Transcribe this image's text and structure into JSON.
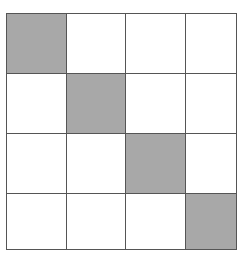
{
  "diagram": {
    "type": "grid-matrix",
    "title": "",
    "rows": 4,
    "columns": 4,
    "colors": {
      "filled_cell": "#a8a8a8",
      "empty_cell": "#ffffff",
      "grid_line": "#555555",
      "background": "#ffffff"
    },
    "pattern_description": "main-diagonal",
    "cells": [
      [
        {
          "row": 1,
          "column": 1,
          "state": "filled",
          "label": ""
        },
        {
          "row": 1,
          "column": 2,
          "state": "empty",
          "label": ""
        },
        {
          "row": 1,
          "column": 3,
          "state": "empty",
          "label": ""
        },
        {
          "row": 1,
          "column": 4,
          "state": "empty",
          "label": ""
        }
      ],
      [
        {
          "row": 2,
          "column": 1,
          "state": "empty",
          "label": ""
        },
        {
          "row": 2,
          "column": 2,
          "state": "filled",
          "label": ""
        },
        {
          "row": 2,
          "column": 3,
          "state": "empty",
          "label": ""
        },
        {
          "row": 2,
          "column": 4,
          "state": "empty",
          "label": ""
        }
      ],
      [
        {
          "row": 3,
          "column": 1,
          "state": "empty",
          "label": ""
        },
        {
          "row": 3,
          "column": 2,
          "state": "empty",
          "label": ""
        },
        {
          "row": 3,
          "column": 3,
          "state": "filled",
          "label": ""
        },
        {
          "row": 3,
          "column": 4,
          "state": "empty",
          "label": ""
        }
      ],
      [
        {
          "row": 4,
          "column": 1,
          "state": "empty",
          "label": ""
        },
        {
          "row": 4,
          "column": 2,
          "state": "empty",
          "label": ""
        },
        {
          "row": 4,
          "column": 3,
          "state": "empty",
          "label": ""
        },
        {
          "row": 4,
          "column": 4,
          "state": "filled",
          "label": ""
        }
      ]
    ]
  }
}
